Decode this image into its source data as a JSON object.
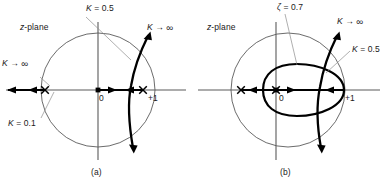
{
  "figure": {
    "type": "root-locus-diagram-pair",
    "background": "#ffffff",
    "stroke_thin": "#4d4d4d",
    "stroke_thick": "#000000",
    "leader_color": "#808080",
    "panels": [
      {
        "id": "a",
        "caption": "(a)",
        "plane_label": "z-plane",
        "unit_circle": {
          "cx": 98,
          "cy": 90,
          "r": 57
        },
        "real_axis_label_origin": "0",
        "real_axis_label_plus_one": "+1",
        "poles": [
          {
            "name": "pole-left",
            "x": 45,
            "y": 90,
            "marker": "x"
          },
          {
            "name": "pole-right",
            "x": 143,
            "y": 90,
            "marker": "x"
          }
        ],
        "origin_marker": {
          "x": 98,
          "y": 90,
          "marker": "square"
        },
        "annotations": [
          {
            "name": "k-eq-0-5",
            "text": "K = 0.5",
            "x": 86,
            "y": 8
          },
          {
            "name": "k-to-infinity-right",
            "text": "K → ∞",
            "x": 147,
            "y": 27
          },
          {
            "name": "k-to-infinity-left",
            "text": "K → ∞",
            "x": 3,
            "y": 63
          },
          {
            "name": "k-eq-0-1",
            "text": "K = 0.1",
            "x": 8,
            "y": 122
          }
        ]
      },
      {
        "id": "b",
        "caption": "(b)",
        "plane_label": "z-plane",
        "unit_circle": {
          "cx": 288,
          "cy": 90,
          "r": 57
        },
        "real_axis_label_origin": "0",
        "real_axis_label_plus_one": "+1",
        "poles": [
          {
            "name": "pole-left",
            "x": 241,
            "y": 90,
            "marker": "x"
          },
          {
            "name": "pole-center",
            "x": 276,
            "y": 90,
            "marker": "x"
          }
        ],
        "constant_damping_oval": {
          "cx": 297,
          "cy": 90,
          "rx": 47,
          "ry": 26
        },
        "annotations": [
          {
            "name": "zeta-eq-0-7",
            "text": "ζ = 0.7",
            "x": 276,
            "y": 4
          },
          {
            "name": "k-to-infinity",
            "text": "K → ∞",
            "x": 337,
            "y": 20
          },
          {
            "name": "k-eq-0-5",
            "text": "K = 0.5",
            "x": 352,
            "y": 47
          }
        ]
      }
    ]
  }
}
